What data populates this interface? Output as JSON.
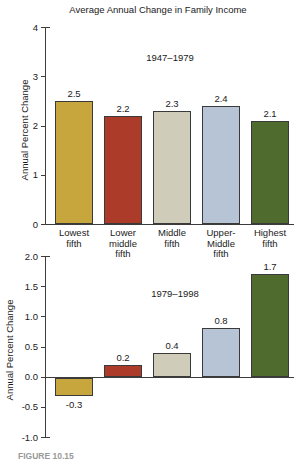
{
  "title": "Average Annual Change in Family Income",
  "caption_fragment": "FIGURE 10.15",
  "colors": {
    "lowest_fifth": "#c8a63e",
    "lower_middle_fifth": "#ad3b2a",
    "middle_fifth": "#cfcdb9",
    "upper_middle_fifth": "#b7c4d6",
    "highest_fifth": "#4f6b2d",
    "bar_border": "#3a3a3a",
    "axis": "#3c3c3c",
    "text": "#1a1a1a"
  },
  "chart_data": [
    {
      "type": "bar",
      "period_label": "1947–1979",
      "ylabel": "Annual Percent Change",
      "categories": [
        "Lowest\nfifth",
        "Lower\nmiddle\nfifth",
        "Middle\nfifth",
        "Upper-\nMiddle\nfifth",
        "Highest\nfifth"
      ],
      "values": [
        2.5,
        2.2,
        2.3,
        2.4,
        2.1
      ],
      "value_labels": [
        "2.5",
        "2.2",
        "2.3",
        "2.4",
        "2.1"
      ],
      "bar_colors": [
        "#c8a63e",
        "#ad3b2a",
        "#cfcdb9",
        "#b7c4d6",
        "#4f6b2d"
      ],
      "ylim": [
        0,
        4
      ],
      "yticks": [
        {
          "v": 4,
          "label": "4"
        },
        {
          "v": 3,
          "label": "3"
        },
        {
          "v": 2,
          "label": "2"
        },
        {
          "v": 1,
          "label": "1"
        },
        {
          "v": 0,
          "label": "0"
        }
      ],
      "grid": false,
      "legend": "none"
    },
    {
      "type": "bar",
      "period_label": "1979–1998",
      "ylabel": "Annual Percent Change",
      "values": [
        -0.3,
        0.2,
        0.4,
        0.8,
        1.7
      ],
      "value_labels": [
        "-0.3",
        "0.2",
        "0.4",
        "0.8",
        "1.7"
      ],
      "bar_colors": [
        "#c8a63e",
        "#ad3b2a",
        "#cfcdb9",
        "#b7c4d6",
        "#4f6b2d"
      ],
      "ylim": [
        -1.0,
        2.0
      ],
      "yticks": [
        {
          "v": 2,
          "label": "2.0"
        },
        {
          "v": 1.5,
          "label": "1.5"
        },
        {
          "v": 1,
          "label": "1.0"
        },
        {
          "v": 0.5,
          "label": "0.5"
        },
        {
          "v": 0,
          "label": "0.0"
        },
        {
          "v": -0.5,
          "label": "-0.5"
        },
        {
          "v": -1,
          "label": "-1.0"
        }
      ],
      "grid": false,
      "legend": "none"
    }
  ]
}
